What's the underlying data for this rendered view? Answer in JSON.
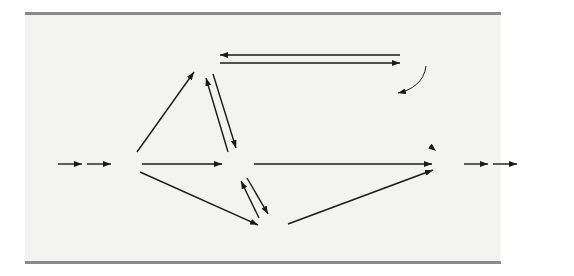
{
  "diagram": {
    "type": "network-flow",
    "nodes": [
      {
        "id": "1",
        "label": "1",
        "x": 127,
        "y": 164
      },
      {
        "id": "2",
        "label": "2",
        "x": 204,
        "y": 60
      },
      {
        "id": "3",
        "label": "3",
        "x": 238,
        "y": 164
      },
      {
        "id": "4",
        "label": "4",
        "x": 415,
        "y": 60
      },
      {
        "id": "5",
        "label": "5",
        "x": 273,
        "y": 230
      },
      {
        "id": "6",
        "label": "6",
        "x": 448,
        "y": 164
      }
    ],
    "edges": [
      {
        "from": "1",
        "to": "2",
        "capacity": "4"
      },
      {
        "from": "1",
        "to": "3",
        "capacity": "3"
      },
      {
        "from": "1",
        "to": "5",
        "capacity": "2"
      },
      {
        "from": "2",
        "to": "4",
        "capacity": "2"
      },
      {
        "from": "4",
        "to": "2",
        "capacity": "2"
      },
      {
        "from": "2",
        "to": "3",
        "capacity": "1"
      },
      {
        "from": "3",
        "to": "2",
        "capacity": "1"
      },
      {
        "from": "3",
        "to": "5",
        "capacity": "2"
      },
      {
        "from": "5",
        "to": "3",
        "capacity": "2"
      },
      {
        "from": "3",
        "to": "6",
        "capacity": "2"
      },
      {
        "from": "4",
        "to": "6",
        "capacity": "5"
      },
      {
        "from": "5",
        "to": "6",
        "capacity": "2"
      }
    ],
    "annotation": {
      "lines": [
        "Vehicle flow",
        "capacity: 5000",
        "vehicles per hour"
      ],
      "points_to_edge": "4-6"
    },
    "colors": {
      "node_fill": "#d4d4d4",
      "node_stroke": "#6a6a6a",
      "edge": "#1a1a1a",
      "panel_bg": "#f3f3f1",
      "rule": "#8a8a8a"
    }
  }
}
